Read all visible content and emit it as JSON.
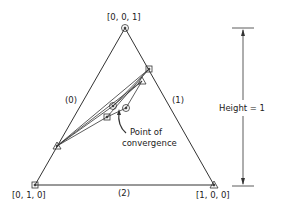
{
  "vertices": {
    "top": "[0, 0, 1]",
    "bottom_left": "[0, 1, 0]",
    "bottom_right": "[1, 0, 0]"
  },
  "edges": {
    "left": "(0)",
    "right": "(1)",
    "bottom": "(2)"
  },
  "annotation": {
    "line1": "Point of",
    "line2": "convergence"
  },
  "height_label": "Height = 1"
}
